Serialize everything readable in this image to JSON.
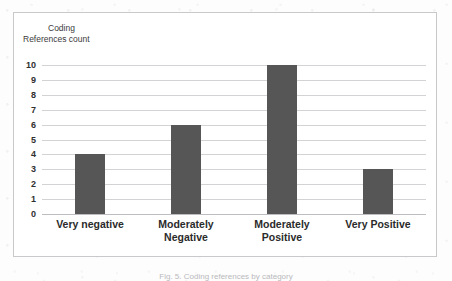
{
  "chart_data": {
    "type": "bar",
    "title": "",
    "axis_title_lines": [
      "Coding",
      "References count"
    ],
    "ylabel": "Coding References count",
    "xlabel": "",
    "categories": [
      "Very negative",
      "Moderately Negative",
      "Moderately Positive",
      "Very Positive"
    ],
    "values": [
      4,
      6,
      10,
      3
    ],
    "ylim": [
      0,
      10
    ],
    "ytick_step": 1,
    "yticks": [
      "10",
      "9",
      "8",
      "7",
      "6",
      "5",
      "4",
      "3",
      "2",
      "1",
      "0"
    ],
    "grid": "horizontal",
    "legend": "none",
    "bar_color": "#565656",
    "gridline_color": "#d3d3d5",
    "frame_color": "#c9c9cb",
    "plot_background": "#ffffff"
  },
  "category_label_lines": [
    [
      "Very negative"
    ],
    [
      "Moderately",
      "Negative"
    ],
    [
      "Moderately",
      "Positive"
    ],
    [
      "Very Positive"
    ]
  ],
  "caption": {
    "text": "Fig. 5. Coding references by category"
  }
}
